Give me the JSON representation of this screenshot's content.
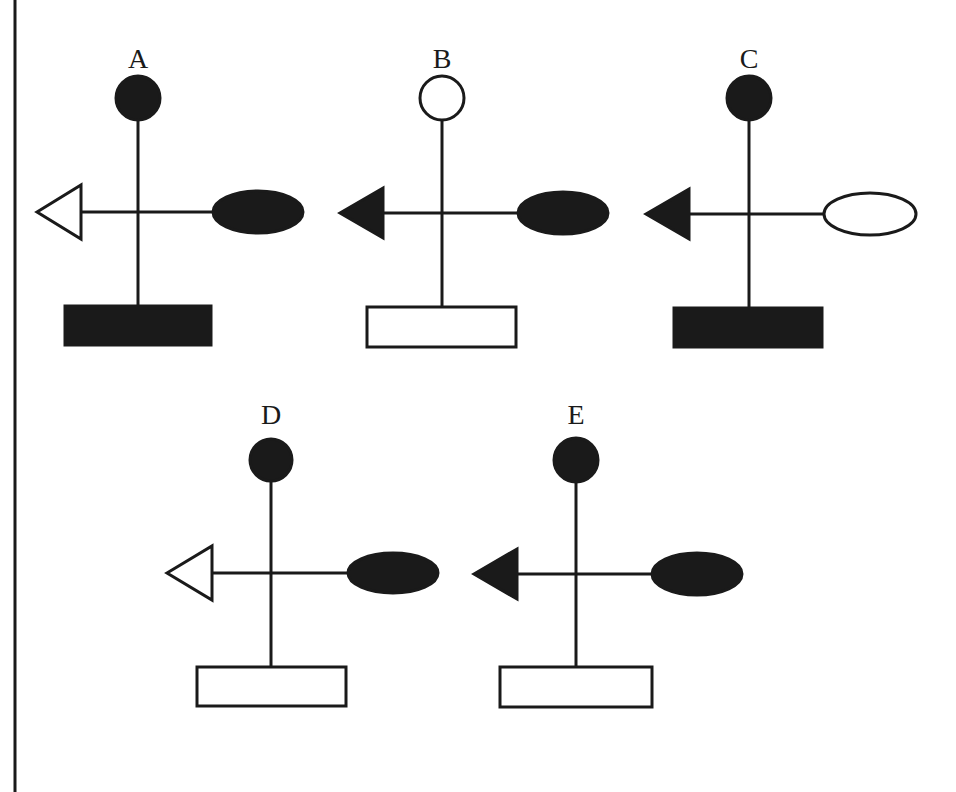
{
  "figure": {
    "colors": {
      "ink": "#1a1a1a",
      "background": "#ffffff"
    },
    "options": [
      {
        "label": "A",
        "cx": 138,
        "labelY": 68,
        "circle": {
          "cy": 98,
          "r": 22,
          "filled": true
        },
        "crossY": 212,
        "stemBottom": 306,
        "triangle": {
          "tip": 37,
          "base": 81,
          "halfH": 27,
          "filled": false
        },
        "ellipse": {
          "cx": 258,
          "rx": 45,
          "ry": 21,
          "filled": true
        },
        "rect": {
          "x": 65,
          "y": 306,
          "w": 146,
          "h": 39,
          "filled": true
        }
      },
      {
        "label": "B",
        "cx": 442,
        "labelY": 68,
        "circle": {
          "cy": 98,
          "r": 22,
          "filled": false
        },
        "crossY": 213,
        "stemBottom": 307,
        "triangle": {
          "tip": 340,
          "base": 383,
          "halfH": 25,
          "filled": true
        },
        "ellipse": {
          "cx": 563,
          "rx": 45,
          "ry": 21,
          "filled": true
        },
        "rect": {
          "x": 367,
          "y": 307,
          "w": 149,
          "h": 40,
          "filled": false
        }
      },
      {
        "label": "C",
        "cx": 749,
        "labelY": 68,
        "circle": {
          "cy": 98,
          "r": 22,
          "filled": true
        },
        "crossY": 214,
        "stemBottom": 308,
        "triangle": {
          "tip": 646,
          "base": 689,
          "halfH": 25,
          "filled": true
        },
        "ellipse": {
          "cx": 870,
          "rx": 46,
          "ry": 21,
          "filled": false
        },
        "rect": {
          "x": 674,
          "y": 308,
          "w": 148,
          "h": 39,
          "filled": true
        }
      },
      {
        "label": "D",
        "cx": 271,
        "labelY": 424,
        "circle": {
          "cy": 460,
          "r": 21,
          "filled": true
        },
        "crossY": 573,
        "stemBottom": 667,
        "triangle": {
          "tip": 167,
          "base": 212,
          "halfH": 27,
          "filled": false
        },
        "ellipse": {
          "cx": 393,
          "rx": 45,
          "ry": 20,
          "filled": true
        },
        "rect": {
          "x": 197,
          "y": 667,
          "w": 149,
          "h": 39,
          "filled": false
        }
      },
      {
        "label": "E",
        "cx": 576,
        "labelY": 424,
        "circle": {
          "cy": 460,
          "r": 22,
          "filled": true
        },
        "crossY": 574,
        "stemBottom": 667,
        "triangle": {
          "tip": 474,
          "base": 517,
          "halfH": 25,
          "filled": true
        },
        "ellipse": {
          "cx": 697,
          "rx": 45,
          "ry": 21,
          "filled": true
        },
        "rect": {
          "x": 500,
          "y": 667,
          "w": 152,
          "h": 40,
          "filled": false
        }
      }
    ]
  }
}
